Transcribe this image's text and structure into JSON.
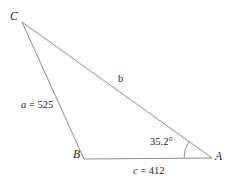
{
  "figure": {
    "type": "triangle-diagram",
    "background_color": "#ffffff",
    "line_color": "#808080",
    "text_color": "#262626"
  },
  "vertices": {
    "C": {
      "label": "C",
      "x": 22,
      "y": 22
    },
    "B": {
      "label": "B",
      "x": 84,
      "y": 159
    },
    "A": {
      "label": "A",
      "x": 212,
      "y": 158
    }
  },
  "sides": {
    "a": {
      "label": "a = 525",
      "value": 525,
      "between": "C to B"
    },
    "b": {
      "label": "b",
      "value": null,
      "between": "C to A"
    },
    "c": {
      "label": "c = 412",
      "value": 412,
      "between": "B to A"
    }
  },
  "angles": {
    "A": {
      "label": "35.2°",
      "value": 35.2,
      "unit": "degrees",
      "at_vertex": "A"
    }
  },
  "chart_data": {
    "type": "diagram",
    "title": "",
    "shape": "triangle",
    "points": [
      {
        "name": "C",
        "x": 22,
        "y": 22
      },
      {
        "name": "B",
        "x": 84,
        "y": 159
      },
      {
        "name": "A",
        "x": 212,
        "y": 158
      }
    ],
    "edges": [
      {
        "from": "C",
        "to": "B",
        "label": "a = 525",
        "value": 525
      },
      {
        "from": "C",
        "to": "A",
        "label": "b",
        "value": null
      },
      {
        "from": "B",
        "to": "A",
        "label": "c = 412",
        "value": 412
      }
    ],
    "angle_marks": [
      {
        "vertex": "A",
        "label": "35.2°",
        "value": 35.2
      }
    ]
  }
}
